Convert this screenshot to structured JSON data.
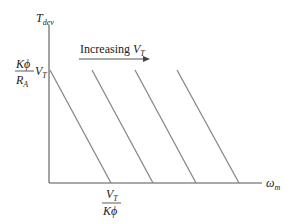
{
  "diagram": {
    "y_axis": {
      "label_main": "T",
      "label_sub": "dev"
    },
    "x_axis": {
      "label_main": "ω",
      "label_sub": "m"
    },
    "y_intercept": {
      "num": "Kϕ",
      "den_main": "R",
      "den_sub": "A",
      "suffix_main": "V",
      "suffix_sub": "T"
    },
    "x_intercept": {
      "num_main": "V",
      "num_sub": "T",
      "den": "Kϕ"
    },
    "annotation": {
      "text": "Increasing ",
      "var_main": "V",
      "var_sub": "T"
    },
    "line_count": 4,
    "colors": {
      "axis": "#555555",
      "line": "#888888",
      "arrow": "#555555"
    }
  }
}
